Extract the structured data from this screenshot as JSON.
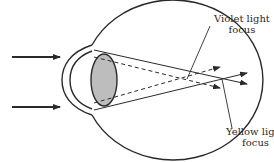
{
  "diagram": {
    "type": "optics-eye-chromatic-aberration",
    "colors": {
      "stroke": "#2a2a2a",
      "lens_fill": "#bdbdbd",
      "background": "#ffffff"
    },
    "labels": {
      "violet": {
        "line1": "Violet light",
        "line2": "focus"
      },
      "yellow": {
        "line1": "Yellow light",
        "line2": "focus"
      }
    },
    "elements": [
      "incoming-arrow-top",
      "incoming-arrow-bottom",
      "eyeball-outline",
      "cornea",
      "lens",
      "violet-rays-dashed",
      "yellow-rays-solid",
      "violet-focus-leader",
      "yellow-focus-leader"
    ]
  }
}
